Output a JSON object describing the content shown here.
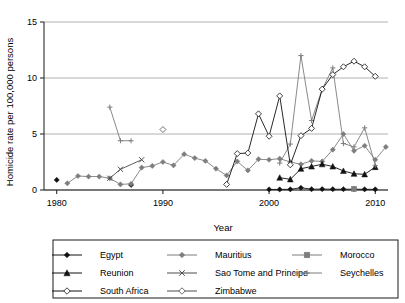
{
  "chart_data": {
    "type": "line",
    "title": "",
    "xlabel": "Year",
    "ylabel": "Homicide rate per 100,000 persons",
    "xlim": [
      1978.8,
      2011.2
    ],
    "ylim": [
      0,
      15
    ],
    "xticks": [
      1980,
      1990,
      2000,
      2010
    ],
    "yticks": [
      0,
      5,
      10,
      15
    ],
    "grid": "horizontal",
    "legend_position": "bottom",
    "series": [
      {
        "name": "Egypt",
        "marker": "filled-diamond",
        "color": "#111111",
        "points": [
          [
            1980,
            0.9
          ],
          [
            1987,
            0.45
          ],
          [
            2000,
            0.05
          ],
          [
            2001,
            0.05
          ],
          [
            2002,
            0.06
          ],
          [
            2003,
            0.2
          ],
          [
            2004,
            0.07
          ],
          [
            2005,
            0.08
          ],
          [
            2006,
            0.07
          ],
          [
            2007,
            0.07
          ],
          [
            2008,
            0.07
          ],
          [
            2009,
            0.06
          ],
          [
            2010,
            0.06
          ]
        ]
      },
      {
        "name": "Mauritius",
        "marker": "filled-diamond",
        "color": "#7d7d7d",
        "points": [
          [
            1981,
            0.6
          ],
          [
            1982,
            1.25
          ],
          [
            1983,
            1.2
          ],
          [
            1984,
            1.2
          ],
          [
            1985,
            1.05
          ],
          [
            1986,
            0.5
          ],
          [
            1987,
            0.55
          ],
          [
            1988,
            2.0
          ],
          [
            1989,
            2.15
          ],
          [
            1990,
            2.5
          ],
          [
            1991,
            2.2
          ],
          [
            1992,
            3.2
          ],
          [
            1993,
            2.85
          ],
          [
            1994,
            2.6
          ],
          [
            1995,
            1.9
          ],
          [
            1996,
            1.3
          ],
          [
            1997,
            2.55
          ],
          [
            1998,
            1.75
          ],
          [
            1999,
            2.75
          ],
          [
            2000,
            2.7
          ],
          [
            2001,
            2.8
          ],
          [
            2002,
            2.5
          ],
          [
            2003,
            2.3
          ],
          [
            2004,
            2.6
          ],
          [
            2005,
            2.55
          ],
          [
            2006,
            3.6
          ],
          [
            2007,
            5.0
          ],
          [
            2008,
            3.5
          ],
          [
            2009,
            3.95
          ],
          [
            2010,
            2.7
          ],
          [
            2011,
            3.85
          ]
        ]
      },
      {
        "name": "Morocco",
        "marker": "filled-square",
        "color": "#7d7d7d",
        "points": [
          [
            2008,
            0.1
          ]
        ]
      },
      {
        "name": "Reunion",
        "marker": "filled-triangle",
        "color": "#111111",
        "points": [
          [
            2001,
            1.1
          ],
          [
            2002,
            0.95
          ],
          [
            2003,
            1.9
          ],
          [
            2004,
            2.1
          ],
          [
            2005,
            2.3
          ],
          [
            2006,
            2.1
          ],
          [
            2007,
            1.7
          ],
          [
            2008,
            1.45
          ],
          [
            2009,
            1.4
          ],
          [
            2010,
            2.05
          ]
        ]
      },
      {
        "name": "Sao Tome and Principe",
        "marker": "x-cross",
        "color": "#4d4d4d",
        "points": [
          [
            1985,
            1.05
          ],
          [
            1986,
            1.85
          ],
          [
            1988,
            2.7
          ]
        ]
      },
      {
        "name": "Seychelles",
        "marker": "plus",
        "color": "#7d7d7d",
        "points": [
          [
            1985,
            7.4
          ],
          [
            1986,
            4.4
          ],
          [
            1987,
            4.4
          ],
          [
            2001,
            2.4
          ],
          [
            2002,
            4.1
          ],
          [
            2003,
            12.0
          ],
          [
            2004,
            6.2
          ],
          [
            2005,
            9.0
          ],
          [
            2006,
            10.9
          ],
          [
            2007,
            4.15
          ],
          [
            2008,
            3.85
          ],
          [
            2009,
            5.55
          ],
          [
            2010,
            2.2
          ]
        ]
      },
      {
        "name": "South Africa",
        "marker": "open-diamond",
        "color": "#111111",
        "points": [
          [
            1996,
            0.5
          ],
          [
            1997,
            3.25
          ],
          [
            1998,
            3.3
          ],
          [
            1999,
            6.8
          ],
          [
            2000,
            4.8
          ],
          [
            2001,
            8.4
          ],
          [
            2002,
            2.25
          ],
          [
            2003,
            4.85
          ],
          [
            2004,
            5.5
          ],
          [
            2005,
            9.0
          ],
          [
            2006,
            10.3
          ],
          [
            2007,
            11.0
          ],
          [
            2008,
            11.5
          ],
          [
            2009,
            11.0
          ],
          [
            2010,
            10.15
          ]
        ]
      },
      {
        "name": "Zimbabwe",
        "marker": "open-diamond",
        "color": "#4d4d4d",
        "points": [
          [
            1990,
            5.4
          ]
        ]
      }
    ]
  },
  "legend": {
    "entries": [
      {
        "label": "Egypt",
        "marker": "filled-diamond",
        "color": "#111111"
      },
      {
        "label": "Mauritius",
        "marker": "filled-diamond",
        "color": "#7d7d7d"
      },
      {
        "label": "Morocco",
        "marker": "filled-square",
        "color": "#7d7d7d"
      },
      {
        "label": "Reunion",
        "marker": "filled-triangle",
        "color": "#111111"
      },
      {
        "label": "Sao Tome and Principe",
        "marker": "x-cross",
        "color": "#4d4d4d"
      },
      {
        "label": "Seychelles",
        "marker": "plus",
        "color": "#7d7d7d"
      },
      {
        "label": "South Africa",
        "marker": "open-diamond",
        "color": "#111111"
      },
      {
        "label": "Zimbabwe",
        "marker": "open-diamond",
        "color": "#4d4d4d"
      }
    ]
  }
}
